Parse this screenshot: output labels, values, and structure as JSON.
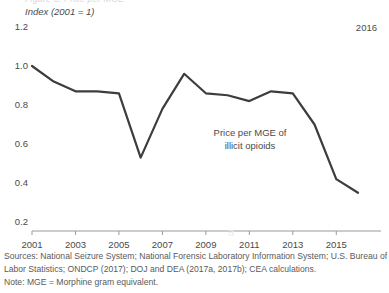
{
  "figure": {
    "cut_off_header": "Figure 3. Price per MGE",
    "axis_title": "Index (2001 = 1)",
    "end_year_label": "2016",
    "annotation_line1": "Price per MGE of",
    "annotation_line2": "illicit opioids",
    "watermark": "a",
    "line_color": "#3d3d3d",
    "text_color": "#4a4a4a"
  },
  "notes": {
    "line1": "Sources: National Seizure System; National Forensic Laboratory Information System; U.S. Bureau of",
    "line2": "Labor Statistics; ONDCP (2017); DOJ and DEA (2017a, 2017b); CEA calculations.",
    "line3": "Note: MGE = Morphine gram equivalent."
  },
  "chart_data": {
    "type": "line",
    "title": "",
    "xlabel": "",
    "ylabel": "Index (2001 = 1)",
    "ylim": [
      0.2,
      1.2
    ],
    "xlim": [
      2001,
      2016
    ],
    "yticks": [
      "1.2",
      "1.0",
      "0.8",
      "0.6",
      "0.4",
      "0.2"
    ],
    "ytick_values": [
      1.2,
      1.0,
      0.8,
      0.6,
      0.4,
      0.2
    ],
    "xticks": [
      "2001",
      "2003",
      "2005",
      "2007",
      "2009",
      "2011",
      "2013",
      "2015"
    ],
    "xtick_values": [
      2001,
      2003,
      2005,
      2007,
      2009,
      2011,
      2013,
      2015
    ],
    "grid": false,
    "legend": "none",
    "series": [
      {
        "name": "Price per MGE of illicit opioids",
        "x": [
          2001,
          2002,
          2003,
          2004,
          2005,
          2006,
          2007,
          2008,
          2009,
          2010,
          2011,
          2012,
          2013,
          2014,
          2015,
          2016
        ],
        "values": [
          1.0,
          0.92,
          0.87,
          0.87,
          0.86,
          0.53,
          0.78,
          0.96,
          0.86,
          0.85,
          0.82,
          0.87,
          0.86,
          0.7,
          0.42,
          0.35
        ]
      }
    ]
  }
}
